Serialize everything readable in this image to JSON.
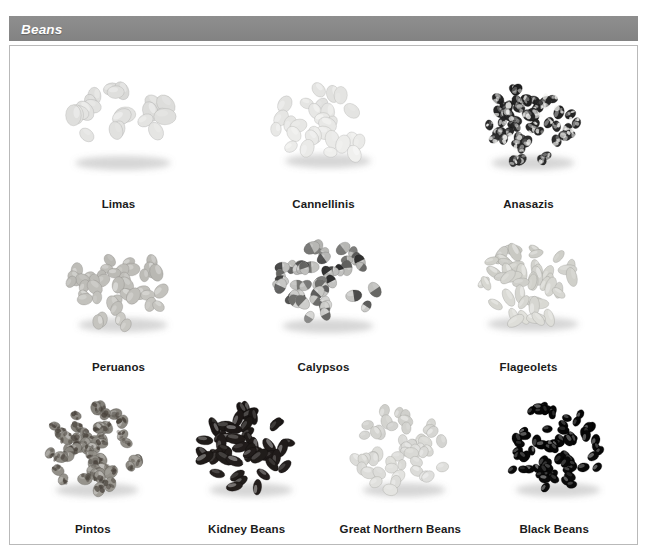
{
  "header": {
    "title": "Beans",
    "bar_color": "#8a8a8a",
    "text_color": "#ffffff"
  },
  "panel": {
    "background": "#ffffff",
    "border_color": "#b9b9b9"
  },
  "chart_data": {
    "type": "table",
    "title": "Beans",
    "layout": "photo grid, 3 rows (3 / 3 / 4 items)",
    "grid": [
      3,
      3,
      4
    ],
    "categories": [
      "Limas",
      "Cannellinis",
      "Anasazis",
      "Peruanos",
      "Calypsos",
      "Flageolets",
      "Pintos",
      "Kidney Beans",
      "Great Northern Beans",
      "Black Beans"
    ],
    "items": [
      {
        "label": "Limas",
        "row": 1,
        "col": 1,
        "bean_count": 22,
        "bean_w": 19,
        "bean_h": 14,
        "base": "#f2f2f0",
        "shade": "#cfcfcd",
        "speckle": "none",
        "pile_w": 120,
        "pile_h": 92
      },
      {
        "label": "Cannellinis",
        "row": 1,
        "col": 2,
        "bean_count": 28,
        "bean_w": 16,
        "bean_h": 12,
        "base": "#f6f6f4",
        "shade": "#d6d6d4",
        "speckle": "none",
        "pile_w": 108,
        "pile_h": 88
      },
      {
        "label": "Anasazis",
        "row": 1,
        "col": 3,
        "bean_count": 54,
        "bean_w": 12,
        "bean_h": 9,
        "base": "#3a3a3a",
        "shade": "#111111",
        "speckle": "heavy",
        "pile_w": 104,
        "pile_h": 92
      },
      {
        "label": "Peruanos",
        "row": 2,
        "col": 1,
        "bean_count": 40,
        "bean_w": 15,
        "bean_h": 11,
        "base": "#d3d2cd",
        "shade": "#a8a7a2",
        "speckle": "none",
        "pile_w": 112,
        "pile_h": 92
      },
      {
        "label": "Calypsos",
        "row": 2,
        "col": 2,
        "bean_count": 50,
        "bean_w": 14,
        "bean_h": 10,
        "base": "#eeeeec",
        "shade": "#8f8f8c",
        "speckle": "half",
        "pile_w": 114,
        "pile_h": 94
      },
      {
        "label": "Flageolets",
        "row": 2,
        "col": 3,
        "bean_count": 46,
        "bean_w": 17,
        "bean_h": 9,
        "base": "#e7e7e2",
        "shade": "#bcbcb6",
        "speckle": "none",
        "pile_w": 114,
        "pile_h": 90
      },
      {
        "label": "Pintos",
        "row": 3,
        "col": 1,
        "bean_count": 52,
        "bean_w": 13,
        "bean_h": 10,
        "base": "#a9a69f",
        "shade": "#6d6a63",
        "speckle": "medium",
        "pile_w": 104,
        "pile_h": 96
      },
      {
        "label": "Kidney Beans",
        "row": 3,
        "col": 2,
        "bean_count": 46,
        "bean_w": 17,
        "bean_h": 9,
        "base": "#2a2422",
        "shade": "#120f0e",
        "speckle": "none",
        "pile_w": 104,
        "pile_h": 96
      },
      {
        "label": "Great Northern Beans",
        "row": 3,
        "col": 3,
        "bean_count": 50,
        "bean_w": 13,
        "bean_h": 10,
        "base": "#ececea",
        "shade": "#c2c2bd",
        "speckle": "none",
        "pile_w": 104,
        "pile_h": 96
      },
      {
        "label": "Black Beans",
        "row": 3,
        "col": 4,
        "bean_count": 72,
        "bean_w": 11,
        "bean_h": 8,
        "base": "#0d0d0d",
        "shade": "#000000",
        "speckle": "none",
        "pile_w": 106,
        "pile_h": 96
      }
    ],
    "xlabel": "",
    "ylabel": "",
    "legend": []
  }
}
